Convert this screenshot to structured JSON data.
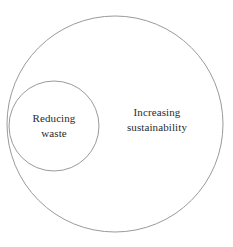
{
  "diagram": {
    "type": "euler-nested-circles",
    "background_color": "#ffffff",
    "stroke_color": "#9a9a9a",
    "text_color": "#2b2b2b",
    "width": 233,
    "height": 247,
    "sets": [
      {
        "id": "outer",
        "name": "increasing-sustainability",
        "label_line_1": "Increasing",
        "label_line_2": "sustainability",
        "label_full": "Increasing sustainability",
        "center_x": 115,
        "center_y": 124,
        "radius": 108,
        "label_center_x": 157,
        "label_center_y": 120
      },
      {
        "id": "inner",
        "name": "reducing-waste",
        "label_line_1": "Reducing",
        "label_line_2": "waste",
        "label_full": "Reducing waste",
        "center_x": 54,
        "center_y": 126,
        "radius": 45,
        "label_center_x": 54,
        "label_center_y": 126
      }
    ]
  }
}
